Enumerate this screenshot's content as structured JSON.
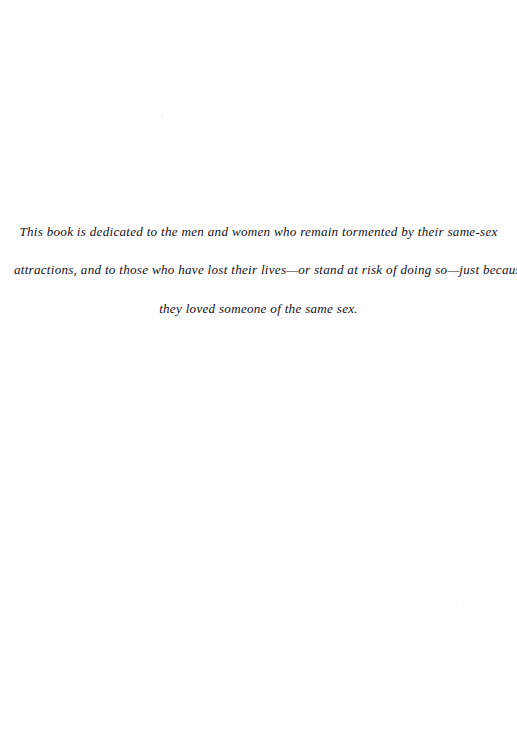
{
  "page": {
    "kind": "book-dedication-page",
    "background_color": "#ffffff",
    "text_color": "#131118",
    "width": 517,
    "height": 748
  },
  "dedication": {
    "lines": [
      "This book is dedicated to the men and women who remain tormented by their same-sex",
      "attractions, and to those who have lost their lives—or stand at risk of doing so—just because",
      "they loved someone of the same sex."
    ],
    "full_text": "This book is dedicated to the men and women who remain tormented by their same-sex attractions, and to those who have lost their lives—or stand at risk of doing so—just because they loved someone of the same sex."
  }
}
